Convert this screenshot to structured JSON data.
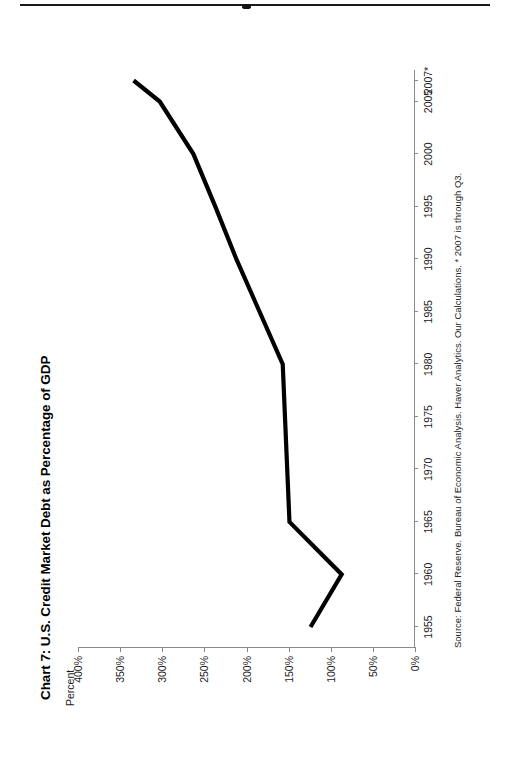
{
  "page": {
    "background": "#ffffff",
    "ink": "#000000",
    "orientation": "rotated-90-ccw"
  },
  "chart_data": {
    "type": "line",
    "title": "Chart 7: U.S. Credit Market Debt as Percentage of GDP",
    "xlabel": "",
    "ylabel": "Percent",
    "source": "Source: Federal Reserve. Bureau of Economic Analysis. Haver Analytics. Our Calculations. * 2007 is through Q3.",
    "grid": false,
    "legend": "none",
    "line_color": "#000000",
    "line_width": 4,
    "x": [
      1955,
      1960,
      1965,
      1980,
      1990,
      1995,
      2000,
      2005,
      2007
    ],
    "x_tick_labels": [
      "1955",
      "1960",
      "1965",
      "1970",
      "1975",
      "1980",
      "1985",
      "1990",
      "1995",
      "2000",
      "2005",
      "2007*"
    ],
    "x_tick_values": [
      1955,
      1960,
      1965,
      1970,
      1975,
      1980,
      1985,
      1990,
      1995,
      2000,
      2005,
      2007
    ],
    "xlim": [
      1953,
      2008
    ],
    "values": [
      124,
      87,
      149,
      157,
      212,
      237,
      263,
      303,
      334
    ],
    "y_tick_labels": [
      "400%",
      "350%",
      "300%",
      "250%",
      "200%",
      "150%",
      "100%",
      "50%",
      "0%"
    ],
    "y_tick_values": [
      400,
      350,
      300,
      250,
      200,
      150,
      100,
      50,
      0
    ],
    "ylim": [
      0,
      400
    ],
    "series": [
      {
        "name": "U.S. Credit Market Debt as % of GDP",
        "points": [
          {
            "year": 1955,
            "value": 124
          },
          {
            "year": 1960,
            "value": 87
          },
          {
            "year": 1965,
            "value": 149
          },
          {
            "year": 1980,
            "value": 157
          },
          {
            "year": 1990,
            "value": 212
          },
          {
            "year": 1995,
            "value": 237
          },
          {
            "year": 2000,
            "value": 263
          },
          {
            "year": 2005,
            "value": 303
          },
          {
            "year": 2007,
            "value": 334
          }
        ]
      }
    ]
  }
}
